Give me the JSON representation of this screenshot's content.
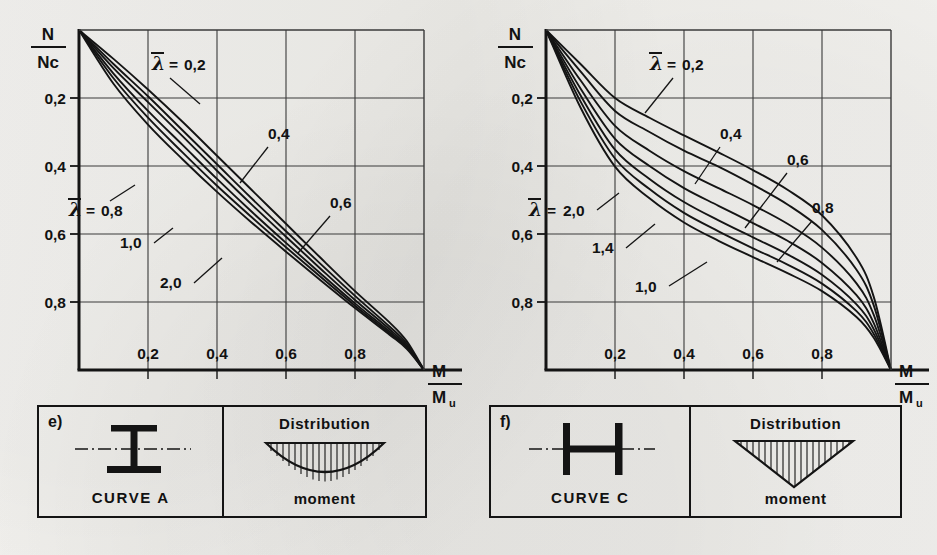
{
  "figure": {
    "background_color": "#f2f1ee",
    "ink_color": "#141414",
    "grid_color": "#3a3a3a"
  },
  "axes": {
    "y_axis_label_numerator": "N",
    "y_axis_label_denominator": "Nc",
    "x_axis_label_numerator": "M",
    "x_axis_label_denominator_main": "M",
    "x_axis_label_denominator_sub": "u",
    "y_ticks": [
      "0,8",
      "0,6",
      "0,4",
      "0,2"
    ],
    "y_tick_values": [
      0.8,
      0.6,
      0.4,
      0.2
    ],
    "x_ticks": [
      "0,2",
      "0,4",
      "0,6",
      "0,8"
    ],
    "x_tick_values": [
      0.2,
      0.4,
      0.6,
      0.8
    ],
    "xlim": [
      0,
      1
    ],
    "ylim": [
      0,
      1
    ],
    "grid": "on",
    "grid_step": 0.2
  },
  "lambda_symbol": "λ",
  "equals_sign": "=",
  "left_chart": {
    "panel_letter": "e)",
    "caption": "CURVE A",
    "section_shape": "i-beam-strong-axis",
    "distribution_title": "Distribution",
    "distribution_caption": "moment",
    "distribution_shape": "parabolic",
    "curve_labels": [
      {
        "text": "0,2",
        "prefixed": true
      },
      {
        "text": "0,4",
        "prefixed": false
      },
      {
        "text": "0,6",
        "prefixed": false
      },
      {
        "text": "0,8",
        "prefixed": true
      },
      {
        "text": "1,0",
        "prefixed": false
      },
      {
        "text": "2,0",
        "prefixed": false
      }
    ]
  },
  "right_chart": {
    "panel_letter": "f)",
    "caption": "CURVE C",
    "section_shape": "i-beam-weak-axis",
    "distribution_title": "Distribution",
    "distribution_caption": "moment",
    "distribution_shape": "triangular",
    "curve_labels": [
      {
        "text": "0,2",
        "prefixed": true
      },
      {
        "text": "0,4",
        "prefixed": false
      },
      {
        "text": "0,6",
        "prefixed": false
      },
      {
        "text": "0,8",
        "prefixed": false
      },
      {
        "text": "1,0",
        "prefixed": false
      },
      {
        "text": "1,4",
        "prefixed": false
      },
      {
        "text": "2,0",
        "prefixed": true
      }
    ]
  },
  "chart_data": [
    {
      "type": "line",
      "id": "left",
      "title": "CURVE A — e)",
      "xlabel": "M/Mu",
      "ylabel": "N/Nc",
      "xlim": [
        0,
        1
      ],
      "ylim": [
        0,
        1
      ],
      "grid": true,
      "xticks": [
        0.2,
        0.4,
        0.6,
        0.8
      ],
      "yticks": [
        0.2,
        0.4,
        0.6,
        0.8
      ],
      "legend": "inline-annotations",
      "legend_variable": "lambda_bar",
      "series": [
        {
          "name": "0,2",
          "lambda": 0.2,
          "x": [
            0,
            0.1,
            0.2,
            0.3,
            0.4,
            0.5,
            0.6,
            0.7,
            0.8,
            0.9,
            0.95,
            1.0
          ],
          "y": [
            1.0,
            0.915,
            0.825,
            0.73,
            0.63,
            0.53,
            0.43,
            0.33,
            0.232,
            0.14,
            0.085,
            0.0
          ]
        },
        {
          "name": "0,4",
          "lambda": 0.4,
          "x": [
            0,
            0.1,
            0.2,
            0.3,
            0.4,
            0.5,
            0.6,
            0.7,
            0.8,
            0.9,
            0.95,
            1.0
          ],
          "y": [
            1.0,
            0.9,
            0.805,
            0.705,
            0.605,
            0.505,
            0.408,
            0.312,
            0.218,
            0.128,
            0.078,
            0.0
          ]
        },
        {
          "name": "0,6",
          "lambda": 0.6,
          "x": [
            0,
            0.1,
            0.2,
            0.3,
            0.4,
            0.5,
            0.6,
            0.7,
            0.8,
            0.9,
            0.95,
            1.0
          ],
          "y": [
            1.0,
            0.888,
            0.788,
            0.688,
            0.586,
            0.487,
            0.392,
            0.298,
            0.206,
            0.12,
            0.072,
            0.0
          ]
        },
        {
          "name": "0,8",
          "lambda": 0.8,
          "x": [
            0,
            0.1,
            0.2,
            0.3,
            0.4,
            0.5,
            0.6,
            0.7,
            0.8,
            0.9,
            0.95,
            1.0
          ],
          "y": [
            1.0,
            0.872,
            0.762,
            0.662,
            0.562,
            0.466,
            0.374,
            0.284,
            0.196,
            0.113,
            0.068,
            0.0
          ]
        },
        {
          "name": "1,0",
          "lambda": 1.0,
          "x": [
            0,
            0.1,
            0.2,
            0.3,
            0.4,
            0.5,
            0.6,
            0.7,
            0.8,
            0.9,
            0.95,
            1.0
          ],
          "y": [
            1.0,
            0.858,
            0.742,
            0.64,
            0.542,
            0.45,
            0.361,
            0.274,
            0.189,
            0.108,
            0.065,
            0.0
          ]
        },
        {
          "name": "2,0",
          "lambda": 2.0,
          "x": [
            0,
            0.1,
            0.2,
            0.3,
            0.4,
            0.5,
            0.6,
            0.7,
            0.8,
            0.9,
            0.95,
            1.0
          ],
          "y": [
            1.0,
            0.842,
            0.722,
            0.62,
            0.524,
            0.434,
            0.348,
            0.264,
            0.182,
            0.104,
            0.062,
            0.0
          ]
        }
      ]
    },
    {
      "type": "line",
      "id": "right",
      "title": "CURVE C — f)",
      "xlabel": "M/Mu",
      "ylabel": "N/Nc",
      "xlim": [
        0,
        1
      ],
      "ylim": [
        0,
        1
      ],
      "grid": true,
      "xticks": [
        0.2,
        0.4,
        0.6,
        0.8
      ],
      "yticks": [
        0.2,
        0.4,
        0.6,
        0.8
      ],
      "legend": "inline-annotations",
      "legend_variable": "lambda_bar",
      "series": [
        {
          "name": "0,2",
          "lambda": 0.2,
          "x": [
            0,
            0.1,
            0.2,
            0.3,
            0.4,
            0.5,
            0.6,
            0.7,
            0.8,
            0.9,
            0.95,
            1.0
          ],
          "y": [
            1.0,
            0.9,
            0.8,
            0.742,
            0.69,
            0.64,
            0.588,
            0.53,
            0.455,
            0.33,
            0.215,
            0.0
          ]
        },
        {
          "name": "0,4",
          "lambda": 0.4,
          "x": [
            0,
            0.1,
            0.2,
            0.3,
            0.4,
            0.5,
            0.6,
            0.7,
            0.8,
            0.9,
            0.95,
            1.0
          ],
          "y": [
            1.0,
            0.878,
            0.762,
            0.7,
            0.645,
            0.598,
            0.545,
            0.487,
            0.412,
            0.295,
            0.19,
            0.0
          ]
        },
        {
          "name": "0,6",
          "lambda": 0.6,
          "x": [
            0,
            0.1,
            0.2,
            0.3,
            0.4,
            0.5,
            0.6,
            0.7,
            0.8,
            0.9,
            0.95,
            1.0
          ],
          "y": [
            1.0,
            0.852,
            0.718,
            0.645,
            0.585,
            0.535,
            0.485,
            0.43,
            0.36,
            0.255,
            0.162,
            0.0
          ]
        },
        {
          "name": "0,8",
          "lambda": 0.8,
          "x": [
            0,
            0.1,
            0.2,
            0.3,
            0.4,
            0.5,
            0.6,
            0.7,
            0.8,
            0.9,
            0.95,
            1.0
          ],
          "y": [
            1.0,
            0.828,
            0.68,
            0.6,
            0.535,
            0.483,
            0.432,
            0.38,
            0.315,
            0.22,
            0.138,
            0.0
          ]
        },
        {
          "name": "1,0",
          "lambda": 1.0,
          "x": [
            0,
            0.1,
            0.2,
            0.3,
            0.4,
            0.5,
            0.6,
            0.7,
            0.8,
            0.9,
            0.95,
            1.0
          ],
          "y": [
            1.0,
            0.808,
            0.648,
            0.562,
            0.494,
            0.44,
            0.39,
            0.34,
            0.28,
            0.193,
            0.12,
            0.0
          ]
        },
        {
          "name": "1,4",
          "lambda": 1.4,
          "x": [
            0,
            0.1,
            0.2,
            0.3,
            0.4,
            0.5,
            0.6,
            0.7,
            0.8,
            0.9,
            0.95,
            1.0
          ],
          "y": [
            1.0,
            0.79,
            0.622,
            0.532,
            0.462,
            0.408,
            0.358,
            0.31,
            0.254,
            0.173,
            0.106,
            0.0
          ]
        },
        {
          "name": "2,0",
          "lambda": 2.0,
          "x": [
            0,
            0.1,
            0.2,
            0.3,
            0.4,
            0.5,
            0.6,
            0.7,
            0.8,
            0.9,
            0.95,
            1.0
          ],
          "y": [
            1.0,
            0.772,
            0.598,
            0.505,
            0.434,
            0.38,
            0.332,
            0.285,
            0.232,
            0.156,
            0.095,
            0.0
          ]
        }
      ]
    }
  ]
}
